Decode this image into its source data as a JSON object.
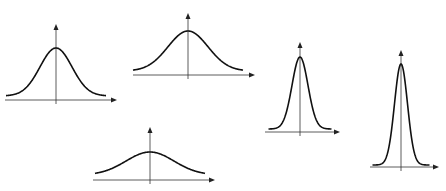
{
  "diagram": {
    "colors": {
      "background": "#ffffff",
      "curve": "#111111",
      "axis": "#333333"
    },
    "curves": [
      {
        "id": "curve-1",
        "label": "",
        "center_x": 56,
        "axis_y": 100,
        "x_from": 5,
        "x_to": 117,
        "axis_top": 24,
        "peak_y": 48,
        "sigma": 16,
        "base_y": 96
      },
      {
        "id": "curve-2",
        "label": "",
        "center_x": 188,
        "axis_y": 75,
        "x_from": 133,
        "x_to": 255,
        "axis_top": 13,
        "peak_y": 31,
        "sigma": 20,
        "base_y": 71
      },
      {
        "id": "curve-3",
        "label": "",
        "center_x": 300,
        "axis_y": 132,
        "x_from": 265,
        "x_to": 340,
        "axis_top": 42,
        "peak_y": 57,
        "sigma": 8,
        "base_y": 129
      },
      {
        "id": "curve-4",
        "label": "",
        "center_x": 401,
        "axis_y": 167,
        "x_from": 370,
        "x_to": 439,
        "axis_top": 50,
        "peak_y": 64,
        "sigma": 6.5,
        "base_y": 165
      },
      {
        "id": "curve-5",
        "label": "",
        "center_x": 150,
        "axis_y": 180,
        "x_from": 93,
        "x_to": 215,
        "axis_top": 127,
        "peak_y": 152,
        "sigma": 24,
        "base_y": 175
      }
    ]
  }
}
